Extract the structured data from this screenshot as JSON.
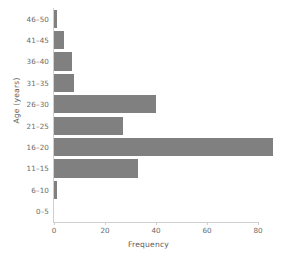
{
  "chart_data": {
    "type": "bar",
    "orientation": "horizontal",
    "title": "",
    "xlabel": "Frequency",
    "ylabel": "Age (years)",
    "categories": [
      "0–5",
      "6–10",
      "11–15",
      "16–20",
      "21–25",
      "26–30",
      "31–35",
      "36–40",
      "41–45",
      "46–50"
    ],
    "values": [
      0,
      1,
      33,
      86,
      27,
      40,
      8,
      7,
      4,
      1
    ],
    "xlim": [
      0,
      90
    ],
    "ylim": [
      0,
      10
    ],
    "xticks": [
      0,
      20,
      40,
      60,
      80
    ],
    "xtick_labels": [
      "0",
      "20",
      "40",
      "60",
      "80"
    ],
    "ytick_labels": [
      "0–5",
      "6–10",
      "11–15",
      "16–20",
      "21–25",
      "26–30",
      "31–35",
      "36–40",
      "41–45",
      "46–50"
    ],
    "grid": false,
    "legend": null,
    "bar_color": "#808080",
    "axis_color": "#cfcfcf",
    "tick_label_color": "#6b6b6b",
    "axis_label_color": "#5a5a5a",
    "background_color": "#ffffff"
  },
  "bars": [
    {
      "label": "46–50",
      "value": 1
    },
    {
      "label": "41–45",
      "value": 4
    },
    {
      "label": "36–40",
      "value": 7
    },
    {
      "label": "31–35",
      "value": 8
    },
    {
      "label": "26–30",
      "value": 40
    },
    {
      "label": "21–25",
      "value": 27
    },
    {
      "label": "16–20",
      "value": 86
    },
    {
      "label": "11–15",
      "value": 33
    },
    {
      "label": "6–10",
      "value": 1
    },
    {
      "label": "0–5",
      "value": 0
    }
  ],
  "xticks": [
    {
      "label": "0",
      "value": 0
    },
    {
      "label": "20",
      "value": 20
    },
    {
      "label": "40",
      "value": 40
    },
    {
      "label": "60",
      "value": 60
    },
    {
      "label": "80",
      "value": 80
    }
  ]
}
